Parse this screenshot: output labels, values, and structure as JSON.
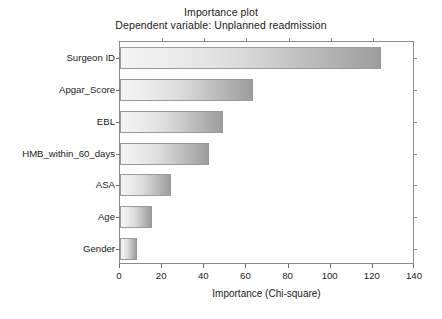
{
  "chart_data": {
    "type": "bar",
    "orientation": "horizontal",
    "title": "Importance plot",
    "subtitle": "Dependent variable: Unplanned readmission",
    "xlabel": "Importance (Chi-square)",
    "ylabel": "",
    "xlim": [
      0,
      140
    ],
    "xticks": [
      0,
      20,
      40,
      60,
      80,
      100,
      120,
      140
    ],
    "grid": false,
    "legend": false,
    "categories": [
      "Surgeon ID",
      "Apgar_Score",
      "EBL",
      "HMB_within_60_days",
      "ASA",
      "Age",
      "Gender"
    ],
    "values": [
      124,
      63,
      49,
      42,
      24,
      15,
      8
    ],
    "bar_style": {
      "fill": "horizontal-gradient-gray",
      "gradient_start": "#f4f4f4",
      "gradient_end": "#9d9d9d",
      "border": "#9a9a9a"
    },
    "frame_color": "#8d8d8d",
    "background": "#ffffff"
  }
}
